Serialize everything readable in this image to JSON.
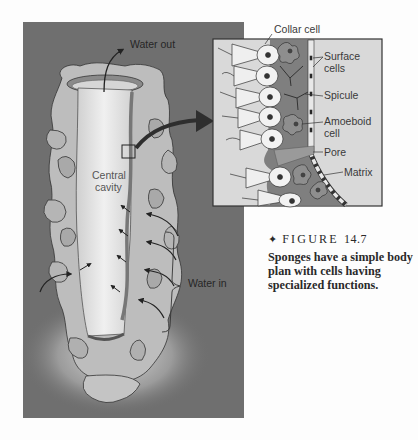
{
  "figure": {
    "number_label": "FIGURE",
    "number": "14.7",
    "bullet": "✦",
    "caption": "Sponges have a simple body plan with cells having specialized functions."
  },
  "main_diagram": {
    "labels": {
      "water_out": "Water out",
      "central_cavity_line1": "Central",
      "central_cavity_line2": "cavity",
      "water_in": "Water in"
    }
  },
  "inset": {
    "labels": {
      "collar_cell": "Collar cell",
      "surface_cells_line1": "Surface",
      "surface_cells_line2": "cells",
      "spicule": "Spicule",
      "amoeboid_line1": "Amoeboid",
      "amoeboid_line2": "cell",
      "pore": "Pore",
      "matrix": "Matrix"
    }
  },
  "colors": {
    "panel_bg": "#6f6f6f",
    "sponge_body": "#b8b8b8",
    "cavity": "#dcdcdc",
    "inset_bg": "#d9d9d9",
    "mesohyl": "#7d7d7d",
    "text": "#3a3a3a"
  }
}
